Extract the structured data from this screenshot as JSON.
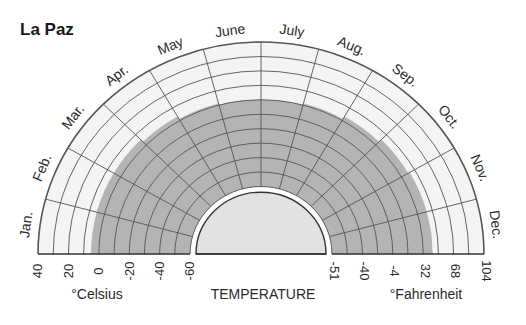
{
  "chart_data": {
    "type": "polar-semicircle",
    "title": "La Paz",
    "subject": "TEMPERATURE",
    "months": [
      "Jan.",
      "Feb.",
      "Mar.",
      "Apr.",
      "May",
      "June",
      "July",
      "Aug.",
      "Sep.",
      "Oct.",
      "Nov.",
      "Dec."
    ],
    "celsius_axis": {
      "label": "°Celsius",
      "ticks": [
        "40",
        "20",
        "0",
        "-20",
        "-40",
        "-60"
      ],
      "tick_values": [
        40,
        20,
        0,
        -20,
        -40,
        -60
      ]
    },
    "fahrenheit_axis": {
      "label": "°Fahrenheit",
      "ticks": [
        "-51",
        "-40",
        "-4",
        "32",
        "68",
        "104"
      ],
      "tick_values": [
        -51,
        -40,
        -4,
        32,
        68,
        104
      ]
    },
    "grid": {
      "ring_step_celsius": 10,
      "ring_range_celsius": [
        -60,
        40
      ],
      "spokes": 12
    },
    "series": [
      {
        "name": "Temperature band (shaded)",
        "lower_celsius": [
          -60,
          -60,
          -60,
          -60,
          -60,
          -60,
          -60,
          -60,
          -60,
          -60,
          -60,
          -60
        ],
        "upper_celsius": [
          5,
          5,
          5,
          3,
          1,
          0,
          0,
          1,
          3,
          5,
          6,
          6
        ]
      }
    ],
    "colors": {
      "shaded": "#b4b4b4",
      "grid": "#555555",
      "background_band": "#f4f4f4",
      "center": "#e2e2e2"
    }
  }
}
